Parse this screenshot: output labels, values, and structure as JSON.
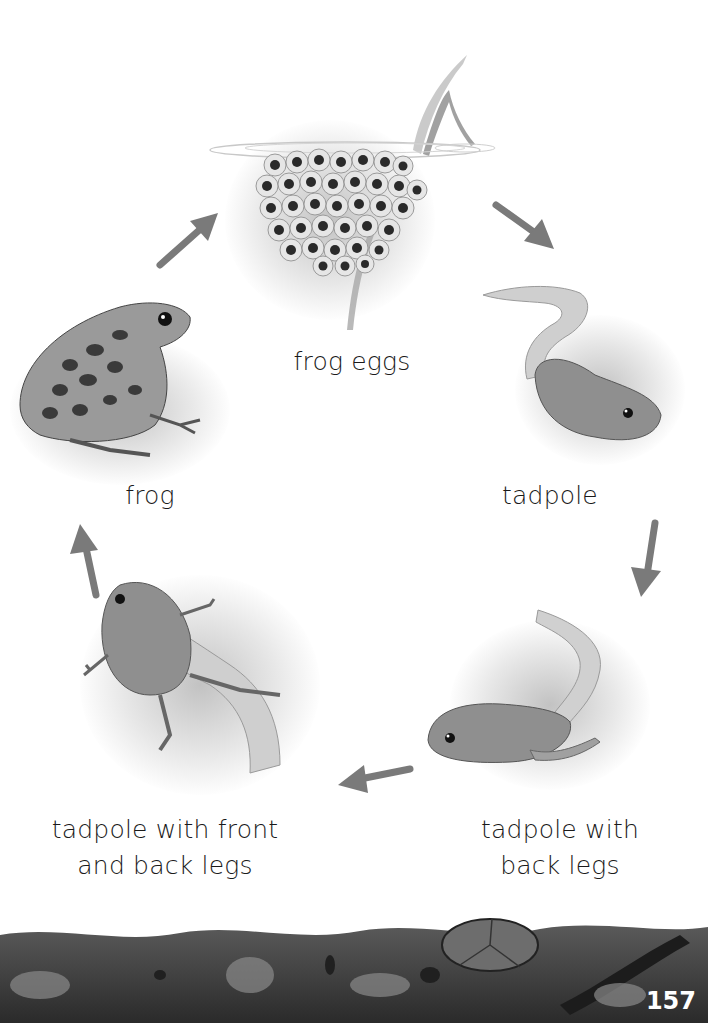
{
  "diagram": {
    "stages": [
      {
        "id": "eggs",
        "label": "frog eggs"
      },
      {
        "id": "tadpole",
        "label": "tadpole"
      },
      {
        "id": "tadpole-back-legs",
        "label_line1": "tadpole with",
        "label_line2": "back legs"
      },
      {
        "id": "tadpole-front-back-legs",
        "label_line1": "tadpole with front",
        "label_line2": "and back legs"
      },
      {
        "id": "frog",
        "label": "frog"
      }
    ],
    "cycle_order": [
      "frog eggs",
      "tadpole",
      "tadpole with back legs",
      "tadpole with front and back legs",
      "frog"
    ],
    "arrow_color": "#7a7a7a"
  },
  "footer": {
    "page_number": "157"
  }
}
